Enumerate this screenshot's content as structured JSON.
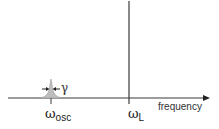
{
  "diagram": {
    "type": "spectrum-schematic",
    "axis": {
      "label": "frequency",
      "direction": "right-arrow"
    },
    "markers": [
      {
        "id": "osc",
        "symbol": "ω",
        "subscript": "osc",
        "shape": "narrow-peak-with-width"
      },
      {
        "id": "laser",
        "symbol": "ω",
        "subscript": "L",
        "shape": "vertical-line"
      }
    ],
    "linewidth": {
      "symbol": "γ"
    },
    "colors": {
      "line": "#3a3a3a",
      "peak_fill": "#bdbdbd",
      "background": "#ffffff"
    }
  }
}
